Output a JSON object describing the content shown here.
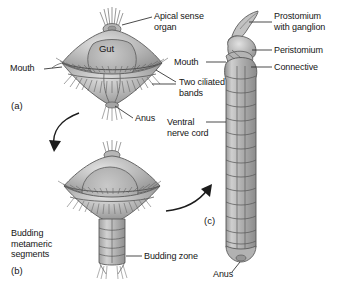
{
  "figure": {
    "background_color": "#ffffff",
    "text_color": "#151515",
    "body_fill_light": "#cfcfcf",
    "body_fill_mid": "#a8a8a8",
    "body_fill_dark": "#8a8a8a",
    "outline_color": "#4a4a4a"
  },
  "panels": [
    {
      "id": "a",
      "id_label": "(a)",
      "name": "trochophore-larva",
      "labels": [
        {
          "key": "apical_sense_organ",
          "text": "Apical sense\norgan",
          "line1": "Apical sense",
          "line2": "organ"
        },
        {
          "key": "gut",
          "text": "Gut"
        },
        {
          "key": "mouth",
          "text": "Mouth"
        },
        {
          "key": "two_ciliated_bands",
          "text": "Two ciliated\nbands",
          "line1": "Two ciliated",
          "line2": "bands"
        },
        {
          "key": "anus",
          "text": "Anus"
        }
      ]
    },
    {
      "id": "b",
      "id_label": "(b)",
      "name": "budding-metameric-stage",
      "labels": [
        {
          "key": "budding_metameric_segments",
          "text": "Budding\nmetameric\nsegments",
          "line1": "Budding",
          "line2": "metameric",
          "line3": "segments"
        },
        {
          "key": "budding_zone",
          "text": "Budding zone"
        }
      ]
    },
    {
      "id": "c",
      "id_label": "(c)",
      "name": "adult-segmented-worm",
      "labels": [
        {
          "key": "prostomium_with_ganglion",
          "text": "Prostomium\nwith ganglion",
          "line1": "Prostomium",
          "line2": "with ganglion"
        },
        {
          "key": "peristomium",
          "text": "Peristomium"
        },
        {
          "key": "mouth",
          "text": "Mouth"
        },
        {
          "key": "connective",
          "text": "Connective"
        },
        {
          "key": "ventral_nerve_cord",
          "text": "Ventral\nnerve cord",
          "line1": "Ventral",
          "line2": "nerve cord"
        },
        {
          "key": "anus",
          "text": "Anus"
        }
      ]
    }
  ],
  "labels": {
    "apical_sense_organ_l1": "Apical sense",
    "apical_sense_organ_l2": "organ",
    "gut": "Gut",
    "mouth_a": "Mouth",
    "two_ciliated_bands_l1": "Two ciliated",
    "two_ciliated_bands_l2": "bands",
    "anus_a": "Anus",
    "budding_metameric_l1": "Budding",
    "budding_metameric_l2": "metameric",
    "budding_metameric_l3": "segments",
    "budding_zone": "Budding zone",
    "prostomium_l1": "Prostomium",
    "prostomium_l2": "with ganglion",
    "peristomium": "Peristomium",
    "mouth_c": "Mouth",
    "connective": "Connective",
    "ventral_nerve_cord_l1": "Ventral",
    "ventral_nerve_cord_l2": "nerve cord",
    "anus_c": "Anus",
    "panel_a": "(a)",
    "panel_b": "(b)",
    "panel_c": "(c)"
  },
  "arrows": [
    {
      "name": "arrow-a-to-b",
      "from_panel": "a",
      "to_panel": "b",
      "direction": "down-left"
    },
    {
      "name": "arrow-b-to-c",
      "from_panel": "b",
      "to_panel": "c",
      "direction": "up-right"
    }
  ]
}
